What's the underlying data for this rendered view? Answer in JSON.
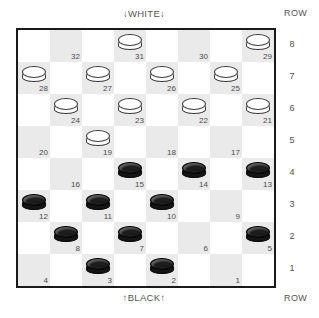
{
  "labels": {
    "white_side": "↓WHITE↓",
    "black_side": "↑BLACK↑",
    "row_caption_top": "ROW",
    "row_caption_bottom": "ROW"
  },
  "row_numbers": [
    "8",
    "7",
    "6",
    "5",
    "4",
    "3",
    "2",
    "1"
  ],
  "colors": {
    "light_square": "#ffffff",
    "dark_square": "#eaeaea",
    "border": "#1a1a1a",
    "white_piece": "#ffffff",
    "black_piece": "#1c1c1c",
    "text": "#4a4a4a"
  },
  "board": {
    "size": 8,
    "square_px": 32,
    "rows": [
      {
        "row": "8",
        "squares": [
          {
            "col": 1,
            "number": "32",
            "piece": "none"
          },
          {
            "col": 3,
            "number": "31",
            "piece": "white"
          },
          {
            "col": 5,
            "number": "30",
            "piece": "none"
          },
          {
            "col": 7,
            "number": "29",
            "piece": "white"
          }
        ]
      },
      {
        "row": "7",
        "squares": [
          {
            "col": 0,
            "number": "28",
            "piece": "white"
          },
          {
            "col": 2,
            "number": "27",
            "piece": "white"
          },
          {
            "col": 4,
            "number": "26",
            "piece": "white"
          },
          {
            "col": 6,
            "number": "25",
            "piece": "white"
          }
        ]
      },
      {
        "row": "6",
        "squares": [
          {
            "col": 1,
            "number": "24",
            "piece": "white"
          },
          {
            "col": 3,
            "number": "23",
            "piece": "white"
          },
          {
            "col": 5,
            "number": "22",
            "piece": "white"
          },
          {
            "col": 7,
            "number": "21",
            "piece": "white"
          }
        ]
      },
      {
        "row": "5",
        "squares": [
          {
            "col": 0,
            "number": "20",
            "piece": "none"
          },
          {
            "col": 2,
            "number": "19",
            "piece": "white"
          },
          {
            "col": 4,
            "number": "18",
            "piece": "none"
          },
          {
            "col": 6,
            "number": "17",
            "piece": "none"
          }
        ]
      },
      {
        "row": "4",
        "squares": [
          {
            "col": 1,
            "number": "16",
            "piece": "none"
          },
          {
            "col": 3,
            "number": "15",
            "piece": "black"
          },
          {
            "col": 5,
            "number": "14",
            "piece": "black"
          },
          {
            "col": 7,
            "number": "13",
            "piece": "black"
          }
        ]
      },
      {
        "row": "3",
        "squares": [
          {
            "col": 0,
            "number": "12",
            "piece": "black"
          },
          {
            "col": 2,
            "number": "11",
            "piece": "black"
          },
          {
            "col": 4,
            "number": "10",
            "piece": "black"
          },
          {
            "col": 6,
            "number": "9",
            "piece": "none"
          }
        ]
      },
      {
        "row": "2",
        "squares": [
          {
            "col": 1,
            "number": "8",
            "piece": "black"
          },
          {
            "col": 3,
            "number": "7",
            "piece": "black"
          },
          {
            "col": 5,
            "number": "6",
            "piece": "none"
          },
          {
            "col": 7,
            "number": "5",
            "piece": "black"
          }
        ]
      },
      {
        "row": "1",
        "squares": [
          {
            "col": 0,
            "number": "4",
            "piece": "none"
          },
          {
            "col": 2,
            "number": "3",
            "piece": "black"
          },
          {
            "col": 4,
            "number": "2",
            "piece": "black"
          },
          {
            "col": 6,
            "number": "1",
            "piece": "none"
          }
        ]
      }
    ]
  }
}
